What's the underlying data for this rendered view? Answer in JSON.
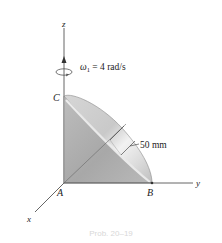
{
  "figure": {
    "axes": {
      "z_label": "z",
      "y_label": "y",
      "x_label": "x"
    },
    "points": {
      "A": "A",
      "B": "B",
      "C": "C"
    },
    "angular_velocity": {
      "symbol": "ω",
      "subscript": "1",
      "value_text": " = 4 rad/s"
    },
    "dimension": {
      "label": "50 mm"
    },
    "caption": "Prob. 20–19"
  },
  "colors": {
    "axis": "#555555",
    "cone_dark": "#a9a9a9",
    "cone_mid": "#c4c4c4",
    "cone_light": "#e6e6e6",
    "text": "#222222"
  }
}
